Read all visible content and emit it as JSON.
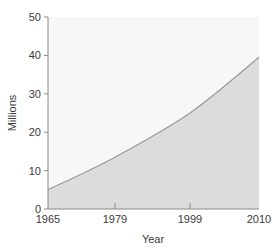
{
  "chart_data": {
    "type": "area",
    "title": "",
    "subtitle": "",
    "xlabel": "Year",
    "ylabel": "Millions",
    "x": [
      1965,
      1979,
      1999,
      2010
    ],
    "categories": [
      "1965",
      "1979",
      "1999",
      "2010"
    ],
    "values": [
      5,
      13.5,
      25,
      39.5
    ],
    "series": [
      {
        "name": "Millions",
        "values": [
          5,
          13.5,
          25,
          39.5
        ]
      }
    ],
    "xtick_labels": [
      "1965",
      "1979",
      "1999",
      "2010"
    ],
    "ytick_labels": [
      "0",
      "10",
      "20",
      "30",
      "40",
      "50"
    ],
    "ytick_values": [
      0,
      10,
      20,
      30,
      40,
      50
    ],
    "ylim": [
      0,
      50
    ],
    "xlim": [
      1965,
      2010
    ],
    "grid": false,
    "legend": false,
    "legend_position": "none",
    "annotations": [],
    "colors": {
      "area_fill": "#dcdcdc",
      "plot_background": "#f7f7f7",
      "line": "#9a9a9a",
      "axis": "#8a8a8a",
      "text": "#3a3a3a",
      "page_background": "#ffffff"
    }
  },
  "axes": {
    "y_label": "Millions",
    "x_label": "Year",
    "y_ticks": [
      {
        "label": "50",
        "value": 50
      },
      {
        "label": "40",
        "value": 40
      },
      {
        "label": "30",
        "value": 30
      },
      {
        "label": "20",
        "value": 20
      },
      {
        "label": "10",
        "value": 10
      },
      {
        "label": "0",
        "value": 0
      }
    ],
    "x_ticks": [
      {
        "label": "1965",
        "value": 1965
      },
      {
        "label": "1979",
        "value": 1979
      },
      {
        "label": "1999",
        "value": 1999
      },
      {
        "label": "2010",
        "value": 2010
      }
    ]
  }
}
